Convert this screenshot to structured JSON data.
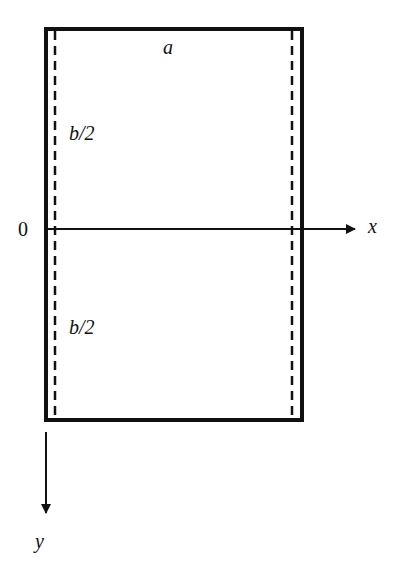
{
  "diagram": {
    "labels": {
      "width": "a",
      "upper_half": "b/2",
      "lower_half": "b/2",
      "origin": "0",
      "x_axis": "x",
      "y_axis": "y"
    },
    "colors": {
      "stroke": "#111111",
      "background": "#ffffff"
    }
  }
}
